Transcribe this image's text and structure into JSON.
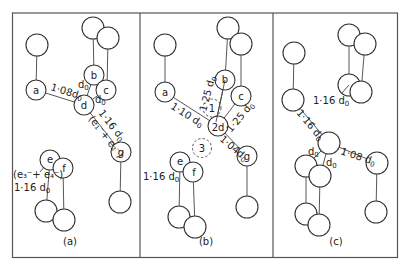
{
  "figure": {
    "panels": [
      {
        "id": "a",
        "caption": "(a)",
        "atoms": {
          "a": "a",
          "b": "b",
          "c": "c",
          "d": "d",
          "e": "e",
          "f": "f",
          "g": "g"
        },
        "labels": {
          "ad": "1·08d",
          "bd": "d",
          "cd": "d",
          "dg": "1·16 d",
          "dg_orbital": "(e₁⁻+ e₂⁻)",
          "ef_orbital": "(e₃⁻+ e₄⁻)",
          "ef": "1·16  d",
          "sub": "0"
        }
      },
      {
        "id": "b",
        "caption": "(b)",
        "atoms": {
          "a": "a",
          "b": "b",
          "c": "c",
          "d": "2d",
          "e": "e",
          "f": "f",
          "g": "g",
          "site1": "1",
          "site3": "3"
        },
        "labels": {
          "ad": "1·10  d",
          "bd": "1·25  d",
          "cd": "1·25  d",
          "dg": "1·04d",
          "ef": "1·16  d",
          "sub": "0"
        }
      },
      {
        "id": "c",
        "caption": "(c)",
        "labels": {
          "top_pair": "1·16  d",
          "left": "1·16  d",
          "d1": "d",
          "d2": "d",
          "right": "1·08  d",
          "sub": "0"
        }
      }
    ]
  }
}
